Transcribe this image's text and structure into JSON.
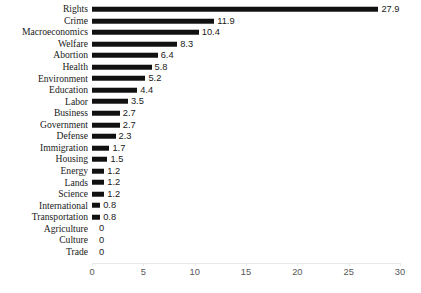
{
  "chart_data": {
    "type": "bar",
    "orientation": "horizontal",
    "title": "",
    "subtitle": "",
    "xlabel": "",
    "ylabel": "",
    "xlim": [
      0,
      30
    ],
    "xticks": [
      0,
      5,
      10,
      15,
      20,
      25,
      30
    ],
    "xtick_labels": [
      "0",
      "5",
      "10",
      "15",
      "20",
      "25",
      "30"
    ],
    "grid": false,
    "legend": false,
    "bar_color": "#111111",
    "axis_color": "#e9e9e9",
    "tick_label_color": "#565656",
    "category_label_color": "#1a1a1a",
    "data_label_color": "#1a1a1a",
    "categories": [
      "Rights",
      "Crime",
      "Macroeconomics",
      "Welfare",
      "Abortion",
      "Health",
      "Environment",
      "Education",
      "Labor",
      "Business",
      "Government",
      "Defense",
      "Immigration",
      "Housing",
      "Energy",
      "Lands",
      "Science",
      "International",
      "Transportation",
      "Agriculture",
      "Culture",
      "Trade"
    ],
    "values": [
      27.9,
      11.9,
      10.4,
      8.3,
      6.4,
      5.8,
      5.2,
      4.4,
      3.5,
      2.7,
      2.7,
      2.3,
      1.7,
      1.5,
      1.2,
      1.2,
      1.2,
      0.8,
      0.8,
      0,
      0,
      0
    ],
    "value_labels": [
      "27.9",
      "11.9",
      "10.4",
      "8.3",
      "6.4",
      "5.8",
      "5.2",
      "4.4",
      "3.5",
      "2.7",
      "2.7",
      "2.3",
      "1.7",
      "1.5",
      "1.2",
      "1.2",
      "1.2",
      "0.8",
      "0.8",
      "0",
      "0",
      "0"
    ]
  }
}
